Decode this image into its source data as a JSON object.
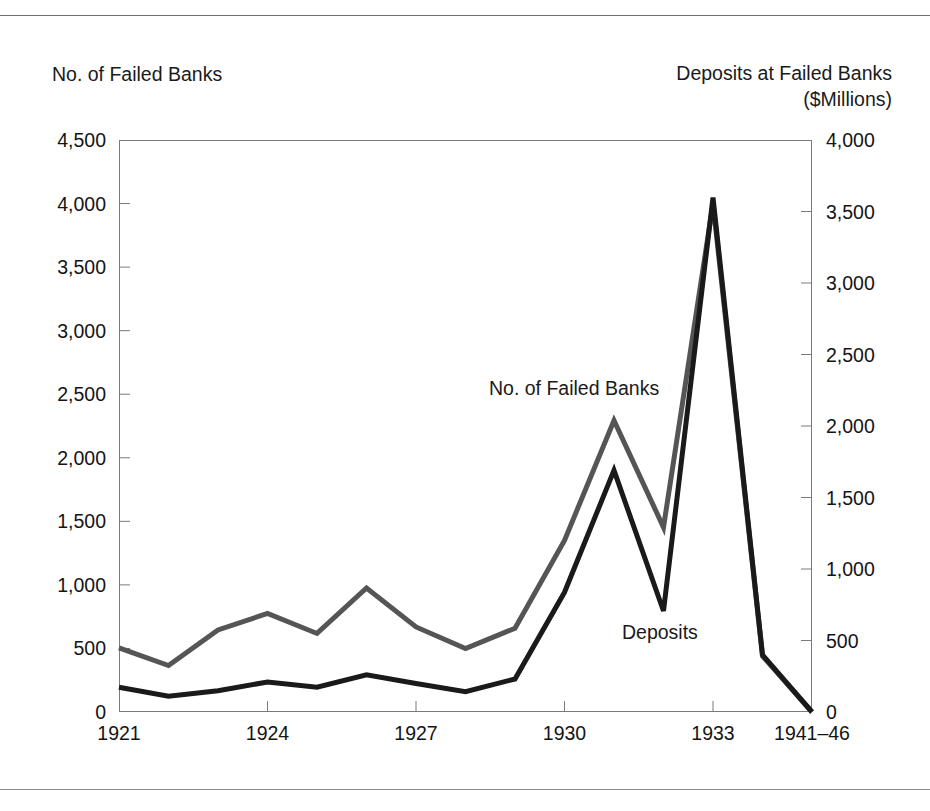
{
  "chart_data": {
    "type": "line",
    "title": "",
    "xlabel": "",
    "left_axis": {
      "label_line1": "No. of Failed Banks",
      "ticks": [
        "0",
        "500",
        "1,000",
        "1,500",
        "2,000",
        "2,500",
        "3,000",
        "3,500",
        "4,000",
        "4,500"
      ],
      "tick_values": [
        0,
        500,
        1000,
        1500,
        2000,
        2500,
        3000,
        3500,
        4000,
        4500
      ],
      "ylim": [
        0,
        4500
      ]
    },
    "right_axis": {
      "label_line1": "Deposits at Failed Banks",
      "label_line2": "($Millions)",
      "ticks": [
        "0",
        "500",
        "1,000",
        "1,500",
        "2,000",
        "2,500",
        "3,000",
        "3,500",
        "4,000"
      ],
      "tick_values": [
        0,
        500,
        1000,
        1500,
        2000,
        2500,
        3000,
        3500,
        4000
      ],
      "ylim": [
        0,
        4000
      ]
    },
    "x_tick_labels": [
      "1921",
      "1924",
      "1927",
      "1930",
      "1933",
      "1941–46"
    ],
    "x_tick_indices": [
      0,
      3,
      6,
      9,
      12,
      14
    ],
    "x": [
      "1921",
      "1922",
      "1923",
      "1924",
      "1925",
      "1926",
      "1927",
      "1928",
      "1929",
      "1930",
      "1931",
      "1932",
      "1933",
      "1934",
      "1941–46"
    ],
    "grid": false,
    "legend": "inline-annotations",
    "annotations": [
      {
        "text": "No. of Failed Banks",
        "series": "No. of Failed Banks"
      },
      {
        "text": "Deposits",
        "series": "Deposits"
      }
    ],
    "series": [
      {
        "name": "No. of Failed Banks",
        "axis": "left",
        "color": "#555555",
        "values": [
          505,
          366,
          646,
          775,
          618,
          976,
          669,
          499,
          659,
          1350,
          2293,
          1453,
          4000,
          440,
          0
        ]
      },
      {
        "name": "Deposits",
        "axis": "right",
        "color": "#1a1a1a",
        "values": [
          173,
          111,
          149,
          210,
          173,
          260,
          199,
          142,
          231,
          837,
          1690,
          706,
          3597,
          400,
          0
        ]
      }
    ]
  },
  "colors": {
    "banks_line": "#555555",
    "deposits_line": "#1a1a1a",
    "frame": "#7b7b7b",
    "rule": "#6e6e6e",
    "text": "#141414"
  }
}
